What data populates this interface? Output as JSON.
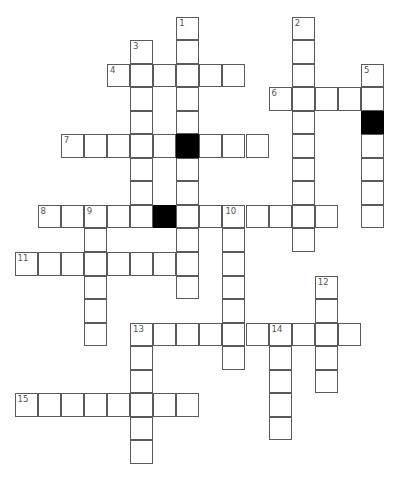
{
  "puzzle": {
    "type": "crossword",
    "grid": {
      "origin_x": 15,
      "origin_y": 17,
      "cell_w": 23.1,
      "cell_h": 23.55,
      "colors": {
        "cell": "#ffffff",
        "border": "#5a5a5a",
        "block": "#000000",
        "number": "#555555"
      }
    },
    "entries": [
      {
        "number": "1",
        "direction": "down",
        "col": 7,
        "row": 0,
        "length": 12
      },
      {
        "number": "2",
        "direction": "down",
        "col": 12,
        "row": 0,
        "length": 10
      },
      {
        "number": "3",
        "direction": "down",
        "col": 5,
        "row": 1,
        "length": 8
      },
      {
        "number": "4",
        "direction": "across",
        "col": 4,
        "row": 2,
        "length": 6
      },
      {
        "number": "5",
        "direction": "down",
        "col": 15,
        "row": 2,
        "length": 7
      },
      {
        "number": "6",
        "direction": "across",
        "col": 11,
        "row": 3,
        "length": 5
      },
      {
        "number": "7",
        "direction": "across",
        "col": 2,
        "row": 5,
        "length": 9
      },
      {
        "number": "8",
        "direction": "across",
        "col": 1,
        "row": 8,
        "length": 13
      },
      {
        "number": "9",
        "direction": "down",
        "col": 3,
        "row": 8,
        "length": 6
      },
      {
        "number": "10",
        "direction": "down",
        "col": 9,
        "row": 8,
        "length": 7
      },
      {
        "number": "11",
        "direction": "across",
        "col": 0,
        "row": 10,
        "length": 8
      },
      {
        "number": "12",
        "direction": "down",
        "col": 13,
        "row": 11,
        "length": 5
      },
      {
        "number": "13",
        "direction": "across",
        "col": 5,
        "row": 13,
        "length": 10
      },
      {
        "number": "13",
        "direction": "down",
        "col": 5,
        "row": 13,
        "length": 6
      },
      {
        "number": "14",
        "direction": "down",
        "col": 11,
        "row": 13,
        "length": 5
      },
      {
        "number": "15",
        "direction": "across",
        "col": 0,
        "row": 16,
        "length": 8
      }
    ],
    "blocks": [
      {
        "col": 7,
        "row": 5
      },
      {
        "col": 15,
        "row": 4
      },
      {
        "col": 6,
        "row": 8
      }
    ]
  }
}
